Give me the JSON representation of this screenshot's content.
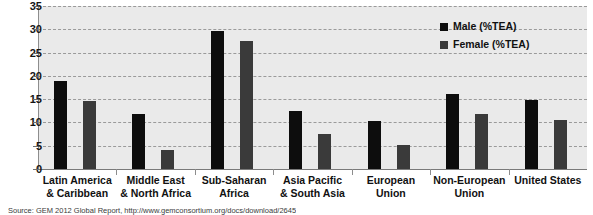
{
  "chart_data": {
    "type": "bar",
    "title": "",
    "xlabel": "",
    "ylabel": "",
    "ylim": [
      0,
      35
    ],
    "yticks": [
      0,
      5,
      10,
      15,
      20,
      25,
      30,
      35
    ],
    "grid": true,
    "legend_position": "top-right",
    "categories": [
      "Latin America\n& Caribbean",
      "Middle East\n& North Africa",
      "Sub-Saharan\nAfrica",
      "Asia Pacific\n& South Asia",
      "European\nUnion",
      "Non-European\nUnion",
      "United States"
    ],
    "category_lines": [
      [
        "Latin America",
        "& Caribbean"
      ],
      [
        "Middle East",
        "& North Africa"
      ],
      [
        "Sub-Saharan",
        "Africa"
      ],
      [
        "Asia Pacific",
        "& South Asia"
      ],
      [
        "European",
        "Union"
      ],
      [
        "Non-European",
        "Union"
      ],
      [
        "United States"
      ]
    ],
    "series": [
      {
        "name": "Male (%TEA)",
        "color": "#0d0d0d",
        "values": [
          19.0,
          11.8,
          29.7,
          12.5,
          10.3,
          16.1,
          14.8
        ]
      },
      {
        "name": "Female (%TEA)",
        "color": "#3a3a3a",
        "values": [
          14.7,
          4.0,
          27.5,
          7.5,
          5.2,
          11.8,
          10.6
        ]
      }
    ]
  },
  "legend": {
    "items": [
      {
        "label": "Male (%TEA)",
        "color": "#0d0d0d"
      },
      {
        "label": "Female (%TEA)",
        "color": "#3a3a3a"
      }
    ]
  },
  "source_note": "Source: GEM 2012 Global Report, http://www.gemconsortium.org/docs/download/2645",
  "colors": {
    "plot_background": "#eaeaea",
    "page_background": "#ffffff",
    "gridline": "#9a9a9a",
    "axis": "#8d8d8d",
    "text": "#111111",
    "male_bar": "#0d0d0d",
    "female_bar": "#3a3a3a"
  }
}
